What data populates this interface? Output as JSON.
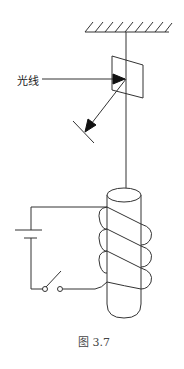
{
  "labels": {
    "light_ray": "光线",
    "caption": "图 3.7"
  },
  "components": {
    "ceiling": "hatched fixed support",
    "string": "suspension thread",
    "mirror": "small plane mirror",
    "incident_ray": "horizontal incoming light ray",
    "reflected_ray": "reflected ray toward screen",
    "screen": "scale / screen",
    "magnet_rod": "cylindrical rod suspended inside coil",
    "coil": "solenoid coil with 3 visible turns",
    "battery": "cell (long and short plates)",
    "switch": "open knife switch"
  },
  "colors": {
    "stroke": "#333333",
    "background": "#ffffff"
  }
}
